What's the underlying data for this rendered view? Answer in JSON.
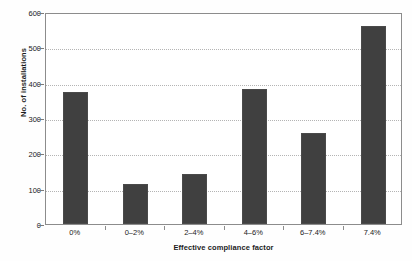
{
  "chart_data": {
    "type": "bar",
    "title": "",
    "categories": [
      "0%",
      "0–2%",
      "2–4%",
      "4–6%",
      "6–7.4%",
      "7.4%"
    ],
    "values": [
      375,
      113,
      142,
      382,
      258,
      560
    ],
    "xlabel": "Effective compliance factor",
    "ylabel": "No. of installations",
    "ylim": [
      0,
      600
    ],
    "yticks": [
      0,
      100,
      200,
      300,
      400,
      500,
      600
    ],
    "ytick_labels": [
      "0",
      "100",
      "200",
      "300",
      "400",
      "500",
      "600"
    ],
    "grid": "horizontal-dotted",
    "legend": "none",
    "bar_color": "#404040",
    "plot_background": "#ffffff",
    "axis_color": "#8c8c8c",
    "gridline_color": "#b4b4b4"
  }
}
